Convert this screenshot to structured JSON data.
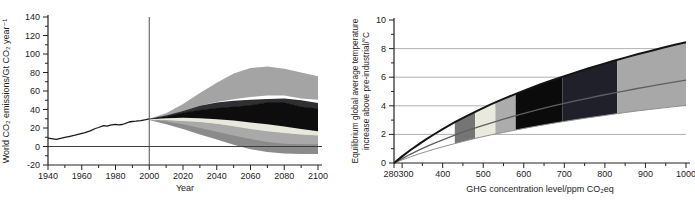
{
  "figure": {
    "background": "#ffffff",
    "panels": [
      "world-co2-emissions-scenarios",
      "equilibrium-temperature-vs-ghg-concentration"
    ]
  },
  "chart_data": [
    {
      "id": "emissions",
      "type": "area",
      "title": "",
      "xlabel": "Year",
      "ylabel": "World CO₂ emissions/Gt CO₂ year⁻¹",
      "xlim": [
        1940,
        2100
      ],
      "ylim": [
        -20,
        140
      ],
      "xticks_major": [
        1940,
        1960,
        1980,
        2000,
        2020,
        2040,
        2060,
        2080,
        2100
      ],
      "xticks_minor": [
        1950,
        1970,
        1990,
        2010,
        2030,
        2050,
        2070,
        2090
      ],
      "yticks_major": [
        -20,
        0,
        20,
        40,
        60,
        80,
        100,
        120,
        140
      ],
      "yticks_minor": [
        -10,
        10,
        30,
        50,
        70,
        90,
        110,
        130
      ],
      "grid": false,
      "reference_lines": {
        "vertical_at_x": 2000,
        "horizontal_at_y": 0
      },
      "historical_series": {
        "name": "historical world CO2 emissions 1940-2000",
        "color": "#1a1a1a",
        "x": [
          1940,
          1942,
          1945,
          1948,
          1950,
          1953,
          1956,
          1959,
          1962,
          1965,
          1968,
          1970,
          1973,
          1975,
          1977,
          1980,
          1982,
          1984,
          1986,
          1988,
          1990,
          1992,
          1995,
          1998,
          2000
        ],
        "y": [
          9,
          8.5,
          7.8,
          9,
          10,
          11,
          12.2,
          13.6,
          15,
          17,
          19.5,
          20.5,
          22.5,
          22,
          23,
          24,
          23.3,
          23.8,
          25,
          26.5,
          27,
          27.3,
          28,
          29,
          29.8
        ]
      },
      "scenario_years": [
        2000,
        2010,
        2020,
        2030,
        2040,
        2050,
        2060,
        2070,
        2080,
        2090,
        2100
      ],
      "scenario_bands": [
        {
          "name": "upper-gray-scenario-range",
          "color": "#a4a4a4",
          "upper": [
            30,
            36,
            46,
            58,
            69,
            79,
            85,
            86.5,
            84,
            80,
            76
          ],
          "lower": [
            30,
            33,
            38,
            44,
            48,
            51,
            53.5,
            55,
            55,
            52,
            50.5
          ]
        },
        {
          "name": "mid-gray-scenario-range",
          "color": "#a9a9a9",
          "upper": [
            29.5,
            29,
            28,
            27,
            25,
            22.5,
            19.5,
            17,
            15,
            13.5,
            12.5
          ],
          "lower": [
            29,
            26,
            22,
            17,
            12.5,
            8,
            4,
            1,
            -1,
            -1.5,
            -1.5
          ]
        },
        {
          "name": "low-gray-scenario-range",
          "color": "#8b8b8b",
          "upper": [
            29,
            27,
            24,
            20,
            16,
            12,
            8,
            5,
            3,
            2.5,
            2.5
          ],
          "lower": [
            28.5,
            24,
            19,
            13,
            7.5,
            2,
            -3,
            -6,
            -7.5,
            -8,
            -8
          ]
        },
        {
          "name": "cream-scenario-range",
          "color": "#e8e8dc",
          "upper": [
            30,
            31,
            31.5,
            31,
            30,
            28.5,
            26.5,
            24.5,
            22,
            19.5,
            17
          ],
          "lower": [
            29,
            28.5,
            27.5,
            26.5,
            24.5,
            22,
            19,
            16.5,
            14.5,
            13,
            12
          ]
        },
        {
          "name": "charcoal-scenario-range",
          "color": "#2e2e33",
          "upper": [
            30,
            33.5,
            38.5,
            44,
            47.5,
            49.5,
            50.5,
            51.5,
            52,
            50,
            47
          ],
          "lower": [
            29.5,
            32,
            36,
            39,
            41,
            42.5,
            44,
            47,
            47,
            42.5,
            40.5
          ]
        },
        {
          "name": "black-scenario-range",
          "color": "#0d0d0d",
          "upper": [
            29.8,
            32.5,
            36.5,
            39.5,
            41.5,
            43,
            44.5,
            47.5,
            47.5,
            43,
            41
          ],
          "lower": [
            29.5,
            30.5,
            31,
            30.5,
            29.5,
            28,
            26,
            24,
            21.5,
            19,
            16.5
          ]
        }
      ]
    },
    {
      "id": "temperature",
      "type": "line",
      "title": "",
      "xlabel": "GHG concentration level/ppm CO₂eq",
      "ylabel_lines": [
        "Equilibrium global average temperature",
        "increase above pre-industrial/°C"
      ],
      "xlim": [
        280,
        1000
      ],
      "ylim": [
        0,
        10
      ],
      "xticks_major": [
        280,
        300,
        400,
        500,
        600,
        700,
        800,
        900,
        1000
      ],
      "xticks_minor": [
        350,
        450,
        550,
        650,
        750,
        850,
        950
      ],
      "yticks_major": [
        0,
        2,
        4,
        6,
        8,
        10
      ],
      "yticks_minor": [
        1,
        3,
        5,
        7,
        9
      ],
      "gridlines_y": [
        2,
        4,
        6,
        8
      ],
      "x": [
        280,
        300,
        320,
        340,
        360,
        380,
        400,
        430,
        460,
        490,
        520,
        550,
        580,
        610,
        640,
        670,
        700,
        730,
        760,
        790,
        820,
        850,
        880,
        910,
        940,
        970,
        1000
      ],
      "curves": [
        {
          "name": "upper-bound-high-climate-sensitivity",
          "color": "#141414",
          "width": 2,
          "y": [
            0,
            0.46,
            0.89,
            1.29,
            1.67,
            2.03,
            2.37,
            2.85,
            3.3,
            3.71,
            4.11,
            4.48,
            4.83,
            5.17,
            5.49,
            5.79,
            6.08,
            6.36,
            6.63,
            6.88,
            7.13,
            7.37,
            7.6,
            7.82,
            8.04,
            8.25,
            8.45
          ]
        },
        {
          "name": "best-estimate",
          "color": "#5f5f5f",
          "width": 1.3,
          "y": [
            0,
            0.31,
            0.61,
            0.88,
            1.14,
            1.39,
            1.62,
            1.95,
            2.26,
            2.54,
            2.81,
            3.07,
            3.31,
            3.54,
            3.76,
            3.97,
            4.17,
            4.36,
            4.54,
            4.72,
            4.88,
            5.05,
            5.21,
            5.36,
            5.51,
            5.65,
            5.79
          ]
        },
        {
          "name": "lower-bound-low-climate-sensitivity",
          "color": "#909090",
          "width": 1,
          "y": [
            0,
            0.22,
            0.42,
            0.62,
            0.8,
            0.97,
            1.13,
            1.36,
            1.58,
            1.78,
            1.97,
            2.14,
            2.31,
            2.47,
            2.62,
            2.77,
            2.91,
            3.04,
            3.17,
            3.29,
            3.41,
            3.53,
            3.64,
            3.74,
            3.84,
            3.94,
            4.04
          ]
        }
      ],
      "category_bands": [
        {
          "name": "category-I",
          "x_range": [
            430,
            480
          ],
          "color": "#757575"
        },
        {
          "name": "category-II",
          "x_range": [
            480,
            530
          ],
          "color": "#e9e9de"
        },
        {
          "name": "category-III",
          "x_range": [
            530,
            580
          ],
          "color": "#acacac"
        },
        {
          "name": "category-IV",
          "x_range": [
            580,
            695
          ],
          "color": "#0b0b0b"
        },
        {
          "name": "category-V",
          "x_range": [
            695,
            830
          ],
          "color": "#20202a"
        },
        {
          "name": "category-VI",
          "x_range": [
            830,
            1000
          ],
          "color": "#a8a8a8"
        }
      ]
    }
  ]
}
